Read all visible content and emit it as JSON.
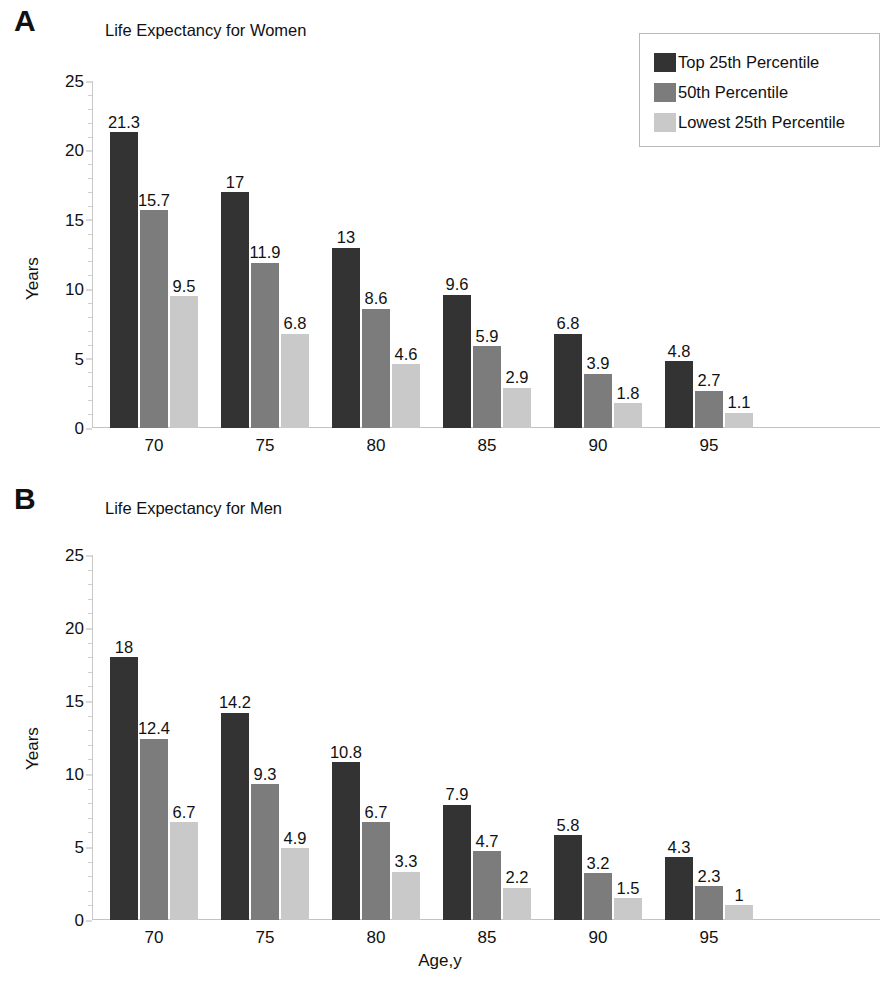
{
  "figure": {
    "x_axis_title": "Age,y"
  },
  "legend": {
    "items": [
      {
        "label": "Top 25th Percentile",
        "color": "#333333"
      },
      {
        "label": "50th Percentile",
        "color": "#7c7c7c"
      },
      {
        "label": "Lowest 25th Percentile",
        "color": "#c9c9c9"
      }
    ]
  },
  "panels": [
    {
      "letter": "A",
      "title": "Life Expectancy for Women",
      "y_axis_title": "Years"
    },
    {
      "letter": "B",
      "title": "Life Expectancy for Men",
      "y_axis_title": "Years"
    }
  ],
  "chart_data": [
    {
      "type": "bar",
      "title": "Life Expectancy for Women",
      "panel": "A",
      "xlabel": "Age,y",
      "ylabel": "Years",
      "ylim": [
        0,
        25
      ],
      "yticks": [
        0,
        5,
        10,
        15,
        20,
        25
      ],
      "grid": false,
      "legend_position": "top-right",
      "categories": [
        "70",
        "75",
        "80",
        "85",
        "90",
        "95"
      ],
      "series": [
        {
          "name": "Top 25th Percentile",
          "color": "#333333",
          "values": [
            21.3,
            17,
            13,
            9.6,
            6.8,
            4.8
          ]
        },
        {
          "name": "50th Percentile",
          "color": "#7c7c7c",
          "values": [
            15.7,
            11.9,
            8.6,
            5.9,
            3.9,
            2.7
          ]
        },
        {
          "name": "Lowest 25th Percentile",
          "color": "#c9c9c9",
          "values": [
            9.5,
            6.8,
            4.6,
            2.9,
            1.8,
            1.1
          ]
        }
      ]
    },
    {
      "type": "bar",
      "title": "Life Expectancy for Men",
      "panel": "B",
      "xlabel": "Age,y",
      "ylabel": "Years",
      "ylim": [
        0,
        25
      ],
      "yticks": [
        0,
        5,
        10,
        15,
        20,
        25
      ],
      "grid": false,
      "legend_position": "none",
      "categories": [
        "70",
        "75",
        "80",
        "85",
        "90",
        "95"
      ],
      "series": [
        {
          "name": "Top 25th Percentile",
          "color": "#333333",
          "values": [
            18,
            14.2,
            10.8,
            7.9,
            5.8,
            4.3
          ]
        },
        {
          "name": "50th Percentile",
          "color": "#7c7c7c",
          "values": [
            12.4,
            9.3,
            6.7,
            4.7,
            3.2,
            2.3
          ]
        },
        {
          "name": "Lowest 25th Percentile",
          "color": "#c9c9c9",
          "values": [
            6.7,
            4.9,
            3.3,
            2.2,
            1.5,
            1
          ]
        }
      ]
    }
  ]
}
